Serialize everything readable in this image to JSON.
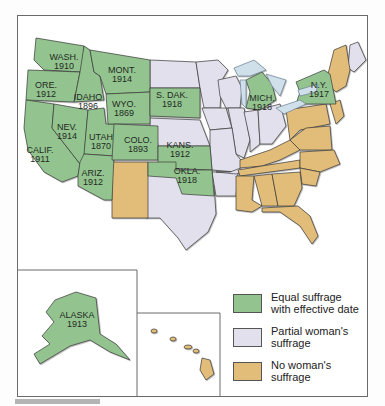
{
  "colors": {
    "equal": "#93c48f",
    "partial": "#e2e0ec",
    "none": "#e2bd79",
    "water": "#cfe0ea",
    "border": "#3a3a3a"
  },
  "states_equal": [
    {
      "abbr": "WASH.",
      "year": "1910"
    },
    {
      "abbr": "ORE.",
      "year": "1912"
    },
    {
      "abbr": "CALIF.",
      "year": "1911"
    },
    {
      "abbr": "IDAHO",
      "year": "1896"
    },
    {
      "abbr": "NEV.",
      "year": "1914"
    },
    {
      "abbr": "UTAH",
      "year": "1870"
    },
    {
      "abbr": "ARIZ.",
      "year": "1912"
    },
    {
      "abbr": "MONT.",
      "year": "1914"
    },
    {
      "abbr": "WYO.",
      "year": "1869"
    },
    {
      "abbr": "COLO.",
      "year": "1893"
    },
    {
      "abbr": "S. DAK.",
      "year": "1918"
    },
    {
      "abbr": "KANS.",
      "year": "1912"
    },
    {
      "abbr": "OKLA.",
      "year": "1918"
    },
    {
      "abbr": "MICH.",
      "year": "1918"
    },
    {
      "abbr": "N.Y.",
      "year": "1917"
    },
    {
      "abbr": "ALASKA",
      "year": "1913"
    }
  ],
  "legend": [
    {
      "key": "equal",
      "label_line1": "Equal suffrage",
      "label_line2": "with effective date"
    },
    {
      "key": "partial",
      "label_line1": "Partial woman's",
      "label_line2": "suffrage"
    },
    {
      "key": "none",
      "label_line1": "No woman's",
      "label_line2": "suffrage"
    }
  ]
}
